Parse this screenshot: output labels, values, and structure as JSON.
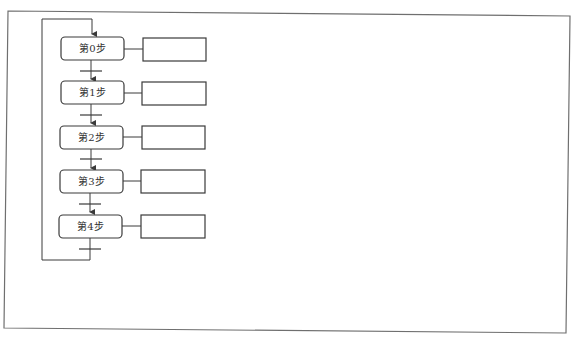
{
  "diagram": {
    "type": "sequential-function-chart",
    "caption_clipped": "",
    "colors": {
      "line": "#3a3a3a",
      "frame": "#6f6f6f",
      "background": "#ffffff"
    },
    "steps": [
      {
        "label": "第0步",
        "action": ""
      },
      {
        "label": "第1步",
        "action": ""
      },
      {
        "label": "第2步",
        "action": ""
      },
      {
        "label": "第3步",
        "action": ""
      },
      {
        "label": "第4步",
        "action": ""
      }
    ],
    "loop": {
      "from": "第4步",
      "to": "第0步"
    }
  }
}
